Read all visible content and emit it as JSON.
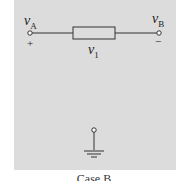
{
  "diagram": {
    "node_a": {
      "label": "v",
      "sub": "A",
      "polarity": "+"
    },
    "node_b": {
      "label": "v",
      "sub": "B",
      "polarity": "−"
    },
    "element": {
      "label": "v",
      "sub": "1"
    },
    "ground": {
      "symbol": "ground-icon"
    },
    "caption": "Case B"
  },
  "colors": {
    "panel": "#dcdcdc",
    "stroke": "#333333"
  }
}
